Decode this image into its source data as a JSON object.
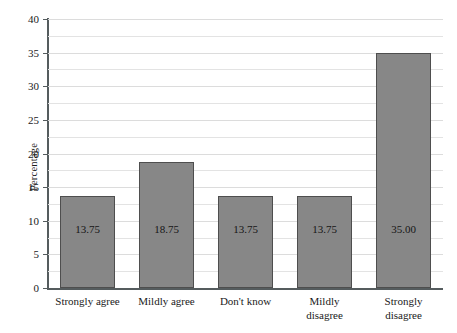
{
  "chart_data": {
    "type": "bar",
    "title": "",
    "xlabel": "",
    "ylabel": "Percentage",
    "categories": [
      "Strongly agree",
      "Mildly agree",
      "Don't know",
      "Mildly disagree",
      "Strongly disagree"
    ],
    "category_lines": [
      [
        "Strongly agree"
      ],
      [
        "Mildly agree"
      ],
      [
        "Don't know"
      ],
      [
        "Mildly",
        "disagree"
      ],
      [
        "Strongly",
        "disagree"
      ]
    ],
    "values": [
      13.75,
      18.75,
      13.75,
      13.75,
      35.0
    ],
    "value_labels": [
      "13.75",
      "18.75",
      "13.75",
      "13.75",
      "35.00"
    ],
    "ylim": [
      0,
      40
    ],
    "ytick_labels": [
      "0",
      "5",
      "10",
      "15",
      "20",
      "25",
      "30",
      "35",
      "40"
    ],
    "ytick_values": [
      0,
      5,
      10,
      15,
      20,
      25,
      30,
      35,
      40
    ],
    "gridline_step": 2.5,
    "grid": true,
    "legend": "none",
    "bar_color": "#878787",
    "bar_edge_color": "#4e4e4e",
    "axis_color": "#555c5e",
    "grid_color": "#e3e3e3",
    "background": "#ffffff"
  }
}
